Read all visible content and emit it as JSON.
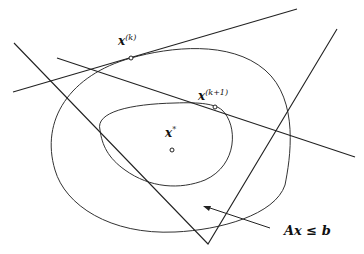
{
  "diagram": {
    "labels": {
      "xk_base": "x",
      "xk_sup": "(k)",
      "xk1_base": "x",
      "xk1_sup": "(k+1)",
      "xstar_base": "x",
      "xstar_sup": "*",
      "constraint": "Ax ≤ b"
    },
    "points": {
      "xk": {
        "x": 131,
        "y": 58
      },
      "xk1": {
        "x": 215,
        "y": 107
      },
      "xstar": {
        "x": 172,
        "y": 150
      }
    },
    "colors": {
      "stroke": "#222222",
      "background": "#ffffff"
    }
  }
}
